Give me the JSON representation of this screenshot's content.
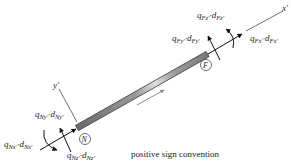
{
  "diagram": {
    "caption": "positive sign convention",
    "axes": {
      "x_axis_label": "x'",
      "y_axis_label": "y'"
    },
    "nodes": {
      "near": "N",
      "far": "F"
    },
    "far_end_labels": {
      "axial": {
        "q": "q",
        "q_sub": "Fx'",
        "d": "d",
        "d_sub": "Fx'"
      },
      "shear": {
        "q": "q",
        "q_sub": "Fy'",
        "d": "d",
        "d_sub": "Fy'"
      },
      "moment": {
        "q": "q",
        "q_sub": "Fz'",
        "d": "d",
        "d_sub": "Fz'"
      }
    },
    "near_end_labels": {
      "axial": {
        "q": "q",
        "q_sub": "Nx'",
        "d": "d",
        "d_sub": "Nx'"
      },
      "shear": {
        "q": "q",
        "q_sub": "Ny'",
        "d": "d",
        "d_sub": "Ny'"
      },
      "moment": {
        "q": "q",
        "q_sub": "Nz'",
        "d": "d",
        "d_sub": "Nz'"
      }
    },
    "colors": {
      "member_dark": "#555555",
      "member_light": "#d8d8d8",
      "ink": "#222222",
      "direction_arrow": "#888888"
    }
  }
}
